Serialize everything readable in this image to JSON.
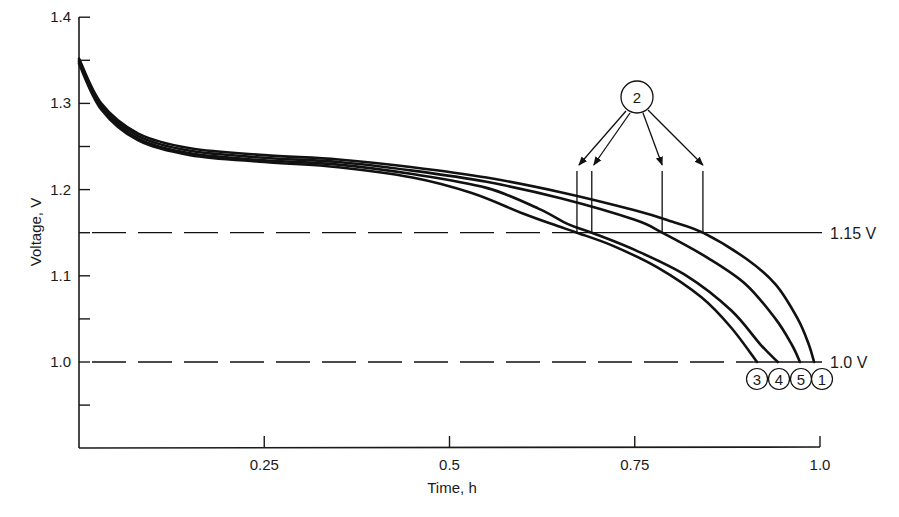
{
  "chart_data": {
    "type": "line",
    "title": "",
    "xlabel": "Time, h",
    "ylabel": "Voltage, V",
    "xlim": [
      0,
      1.0
    ],
    "ylim": [
      0.9,
      1.4
    ],
    "grid": false,
    "legend_position": "none (curves labelled with circled numbers at 1.0 V cutoff)",
    "x_ticks": [
      {
        "value": 0.25,
        "label": "0.25"
      },
      {
        "value": 0.5,
        "label": "0.5"
      },
      {
        "value": 0.75,
        "label": "0.75"
      },
      {
        "value": 1.0,
        "label": "1.0"
      }
    ],
    "y_ticks": [
      {
        "value": 1.4,
        "label": "1.4"
      },
      {
        "value": 1.35,
        "label": ""
      },
      {
        "value": 1.3,
        "label": "1.3"
      },
      {
        "value": 1.25,
        "label": ""
      },
      {
        "value": 1.2,
        "label": "1.2"
      },
      {
        "value": 1.15,
        "label": ""
      },
      {
        "value": 1.1,
        "label": "1.1"
      },
      {
        "value": 1.05,
        "label": ""
      },
      {
        "value": 1.0,
        "label": "1.0"
      },
      {
        "value": 0.95,
        "label": ""
      }
    ],
    "reference_lines": [
      {
        "value": 1.15,
        "label": "1.15 V",
        "style": "dashed-then-solid"
      },
      {
        "value": 1.0,
        "label": "1.0 V",
        "style": "dashed-then-solid"
      }
    ],
    "series": [
      {
        "name": "1",
        "points": [
          [
            0,
            1.352
          ],
          [
            0.03,
            1.3
          ],
          [
            0.08,
            1.265
          ],
          [
            0.15,
            1.248
          ],
          [
            0.25,
            1.24
          ],
          [
            0.35,
            1.235
          ],
          [
            0.45,
            1.226
          ],
          [
            0.55,
            1.214
          ],
          [
            0.65,
            1.197
          ],
          [
            0.75,
            1.176
          ],
          [
            0.8,
            1.163
          ],
          [
            0.842,
            1.15
          ],
          [
            0.9,
            1.12
          ],
          [
            0.94,
            1.09
          ],
          [
            0.97,
            1.05
          ],
          [
            0.985,
            1.02
          ],
          [
            0.992,
            1.0
          ]
        ]
      },
      {
        "name": "5",
        "points": [
          [
            0,
            1.35
          ],
          [
            0.03,
            1.298
          ],
          [
            0.08,
            1.262
          ],
          [
            0.15,
            1.245
          ],
          [
            0.25,
            1.237
          ],
          [
            0.35,
            1.232
          ],
          [
            0.45,
            1.222
          ],
          [
            0.55,
            1.209
          ],
          [
            0.65,
            1.19
          ],
          [
            0.75,
            1.165
          ],
          [
            0.787,
            1.15
          ],
          [
            0.85,
            1.12
          ],
          [
            0.9,
            1.09
          ],
          [
            0.94,
            1.05
          ],
          [
            0.962,
            1.02
          ],
          [
            0.973,
            1.0
          ]
        ]
      },
      {
        "name": "4",
        "points": [
          [
            0,
            1.348
          ],
          [
            0.03,
            1.295
          ],
          [
            0.08,
            1.259
          ],
          [
            0.15,
            1.242
          ],
          [
            0.25,
            1.234
          ],
          [
            0.35,
            1.229
          ],
          [
            0.45,
            1.218
          ],
          [
            0.55,
            1.202
          ],
          [
            0.62,
            1.178
          ],
          [
            0.66,
            1.16
          ],
          [
            0.692,
            1.15
          ],
          [
            0.75,
            1.13
          ],
          [
            0.82,
            1.1
          ],
          [
            0.88,
            1.06
          ],
          [
            0.92,
            1.02
          ],
          [
            0.943,
            1.0
          ]
        ]
      },
      {
        "name": "3",
        "points": [
          [
            0,
            1.346
          ],
          [
            0.03,
            1.293
          ],
          [
            0.08,
            1.257
          ],
          [
            0.15,
            1.24
          ],
          [
            0.25,
            1.232
          ],
          [
            0.35,
            1.226
          ],
          [
            0.45,
            1.214
          ],
          [
            0.53,
            1.196
          ],
          [
            0.6,
            1.172
          ],
          [
            0.645,
            1.158
          ],
          [
            0.672,
            1.15
          ],
          [
            0.72,
            1.135
          ],
          [
            0.78,
            1.11
          ],
          [
            0.84,
            1.075
          ],
          [
            0.88,
            1.04
          ],
          [
            0.915,
            1.0
          ]
        ]
      }
    ],
    "annotations": [
      {
        "label": "2",
        "type": "circled callout with 4 arrows",
        "points_to": "1.15 V crossings",
        "x_values": [
          0.672,
          0.692,
          0.787,
          0.842
        ]
      },
      {
        "label": "3",
        "type": "circled label",
        "x": 0.915,
        "y": 1.0
      },
      {
        "label": "4",
        "type": "circled label",
        "x": 0.943,
        "y": 1.0
      },
      {
        "label": "5",
        "type": "circled label",
        "x": 0.973,
        "y": 1.0
      },
      {
        "label": "1",
        "type": "circled label",
        "x": 0.992,
        "y": 1.0
      }
    ],
    "colors": {
      "line": "#111111",
      "background": "#ffffff"
    }
  }
}
